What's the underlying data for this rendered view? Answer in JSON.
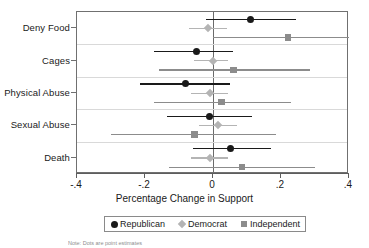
{
  "chart_data": {
    "type": "scatter",
    "title": "",
    "subtitle": "",
    "xlabel": "Percentage Change in Support",
    "ylabel": "",
    "xlim": [
      -0.4,
      0.4
    ],
    "xticks": [
      -0.4,
      -0.2,
      0.0,
      0.2,
      0.4
    ],
    "xticklabels": [
      "-.4",
      "-.2",
      "0",
      ".2",
      ".4"
    ],
    "grid": false,
    "zero_reference_line": 0.0,
    "legend_position": "bottom-center",
    "categories": [
      "Deny Food",
      "Cages",
      "Physical Abuse",
      "Sexual Abuse",
      "Death"
    ],
    "series": [
      {
        "name": "Republican",
        "marker": "circle",
        "color": "#1a1a1a",
        "values": [
          0.11,
          -0.05,
          -0.08,
          -0.01,
          0.05
        ],
        "ci_low": [
          -0.02,
          -0.175,
          -0.215,
          -0.135,
          -0.06
        ],
        "ci_high": [
          0.245,
          0.06,
          0.05,
          0.115,
          0.17
        ]
      },
      {
        "name": "Democrat",
        "marker": "diamond",
        "color": "#b4b4b4",
        "values": [
          -0.015,
          0.0,
          -0.01,
          0.015,
          -0.01
        ],
        "ci_low": [
          -0.07,
          -0.055,
          -0.065,
          -0.04,
          -0.065
        ],
        "ci_high": [
          0.04,
          0.045,
          0.045,
          0.07,
          0.045
        ]
      },
      {
        "name": "Independent",
        "marker": "square",
        "color": "#8c8c8c",
        "values": [
          0.22,
          0.06,
          0.025,
          -0.055,
          0.085
        ],
        "ci_low": [
          0.0,
          -0.16,
          -0.175,
          -0.3,
          -0.13
        ],
        "ci_high": [
          0.41,
          0.285,
          0.23,
          0.185,
          0.3
        ]
      }
    ]
  },
  "axis": {
    "xtitle": "Percentage Change in Support",
    "ticklabels": [
      "-.4",
      "-.2",
      "0",
      ".2",
      ".4"
    ],
    "categories": [
      "Deny Food",
      "Cages",
      "Physical Abuse",
      "Sexual Abuse",
      "Death"
    ]
  },
  "legend": {
    "entries": [
      {
        "label": "Republican",
        "marker": "circle",
        "color": "#1a1a1a"
      },
      {
        "label": "Democrat",
        "marker": "diamond",
        "color": "#b4b4b4"
      },
      {
        "label": "Independent",
        "marker": "square",
        "color": "#8c8c8c"
      }
    ]
  },
  "note": {
    "text": "Note: Dots are point estimates"
  }
}
